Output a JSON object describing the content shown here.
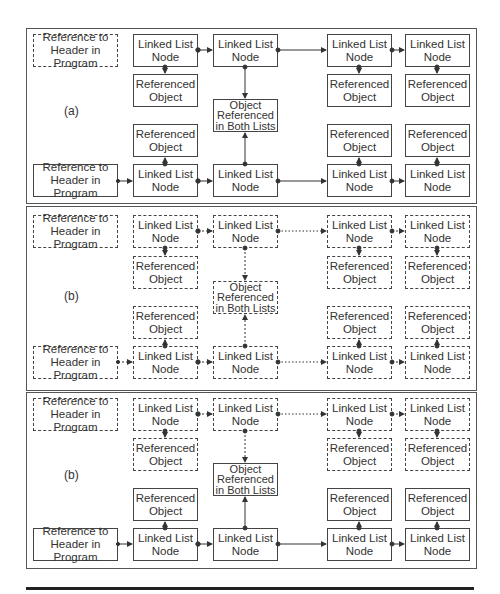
{
  "labels": {
    "header": "Reference to\nHeader in Program",
    "node": "Linked List\nNode",
    "ref_obj": "Referenced\nObject",
    "shared": "Object\nReferenced\nin Both Lists"
  },
  "panels": [
    {
      "label": "(a)",
      "top_list_style": "solid",
      "top_header_style": "dashed",
      "bottom_list_style": "solid"
    },
    {
      "label": "(b)",
      "top_list_style": "dashed",
      "top_header_style": "dashed",
      "bottom_list_style": "dashed",
      "shared_style": "dashed"
    },
    {
      "label": "(b)",
      "top_list_style": "dashed",
      "top_header_style": "dashed",
      "bottom_list_style": "solid",
      "shared_style": "solid"
    }
  ],
  "colors": {
    "line": "#444444",
    "rule": "#222222"
  }
}
